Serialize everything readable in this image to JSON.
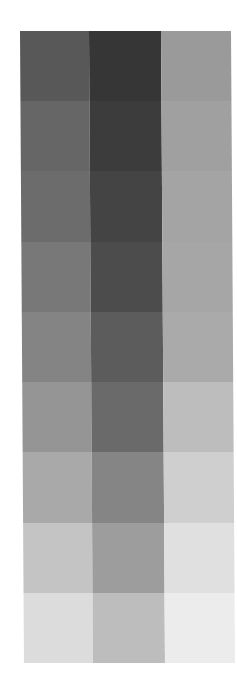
{
  "palette": {
    "columns": 3,
    "rows": 9,
    "swatches": [
      [
        "#585858",
        "#363636",
        "#9a9a9a"
      ],
      [
        "#666666",
        "#3c3c3c",
        "#a0a0a0"
      ],
      [
        "#6c6c6c",
        "#444444",
        "#a4a4a4"
      ],
      [
        "#787878",
        "#4c4c4c",
        "#a6a6a6"
      ],
      [
        "#848484",
        "#5c5c5c",
        "#aaaaaa"
      ],
      [
        "#959595",
        "#6a6a6a",
        "#bdbdbd"
      ],
      [
        "#a9a9a9",
        "#858585",
        "#cfcfcf"
      ],
      [
        "#c4c4c4",
        "#9d9d9d",
        "#e0e0e0"
      ],
      [
        "#dcdcdc",
        "#bdbdbd",
        "#ececec"
      ]
    ]
  }
}
